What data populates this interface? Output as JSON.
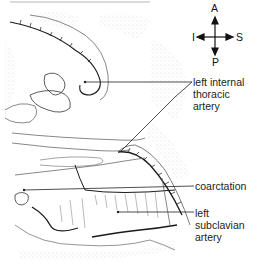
{
  "figure": {
    "type": "anatomical line drawing",
    "colors": {
      "ink": "#1a1a1a",
      "stipple": "#9a9a9a",
      "leader": "#222222"
    }
  },
  "orientation": {
    "top": "A",
    "bottom": "P",
    "left": "I",
    "right": "S"
  },
  "labels": [
    {
      "id": "left-internal-thoracic-artery",
      "lines": [
        "left internal",
        "thoracic",
        "artery"
      ]
    },
    {
      "id": "coarctation",
      "lines": [
        "coarctation"
      ]
    },
    {
      "id": "left-subclavian-artery",
      "lines": [
        "left",
        "subclavian",
        "artery"
      ]
    }
  ]
}
